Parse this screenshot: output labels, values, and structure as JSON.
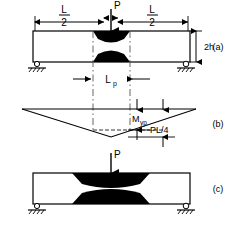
{
  "figure": {
    "panels": [
      {
        "id": "a",
        "label": "(a)",
        "description": "Beam at first yield - small plastic wedges at midspan top and bottom"
      },
      {
        "id": "b",
        "label": "(b)",
        "description": "Triangular bending moment diagram with yield moment level and peak moment"
      },
      {
        "id": "c",
        "label": "(c)",
        "description": "Beam at full plastic hinge - large spread plastic zones at midspan"
      }
    ],
    "annotations": {
      "load_label": "P",
      "half_span_numerator": "L",
      "half_span_denominator": "2",
      "depth_label": "2h",
      "plastic_length_base": "L",
      "plastic_length_sub": "p",
      "yield_moment_base": "M",
      "yield_moment_sub": "yp",
      "peak_moment_label": "PL/4"
    },
    "colors": {
      "ink": "#000000",
      "plastic_fill": "#000000",
      "dash_line": "#555555",
      "background": "#ffffff"
    },
    "geometry": {
      "beam_a": {
        "left": 33,
        "right": 190,
        "top": 31,
        "bottom": 62
      },
      "beam_c": {
        "left": 33,
        "right": 190,
        "top": 173,
        "bottom": 204
      },
      "midspan_x": 111,
      "plastic_zone_a_left": 93,
      "plastic_zone_a_right": 130,
      "moment_diagram": {
        "left": 22,
        "right": 196,
        "baseline_y": 109,
        "apex_y": 137
      }
    }
  }
}
